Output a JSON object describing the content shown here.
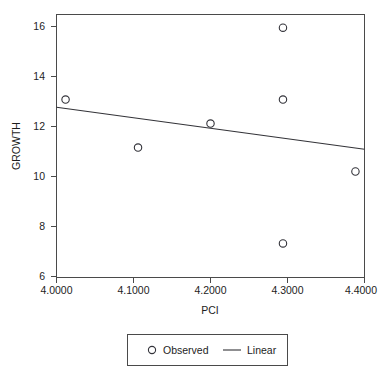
{
  "chart_data": {
    "type": "scatter",
    "title": "",
    "xlabel": "PCI",
    "ylabel": "GROWTH",
    "xlim": [
      3.9875,
      4.4125
    ],
    "ylim": [
      5.6,
      16.55
    ],
    "grid": false,
    "legend_position": "bottom",
    "x_ticks": [
      "4.0000",
      "4.1000",
      "4.2000",
      "4.3000",
      "4.4000"
    ],
    "x_tick_values": [
      4.0,
      4.1,
      4.2,
      4.3,
      4.4
    ],
    "y_ticks": [
      "6",
      "8",
      "10",
      "12",
      "14",
      "16"
    ],
    "y_tick_values": [
      6,
      8,
      10,
      12,
      14,
      16
    ],
    "series": [
      {
        "name": "Observed",
        "type": "scatter",
        "marker": "open-circle",
        "x": [
          4.0,
          4.1,
          4.2,
          4.3,
          4.3,
          4.3,
          4.4
        ],
        "y": [
          13,
          11,
          12,
          16,
          13,
          7,
          10
        ],
        "points": [
          {
            "x": 4.0,
            "y": 13
          },
          {
            "x": 4.1,
            "y": 11
          },
          {
            "x": 4.2,
            "y": 12
          },
          {
            "x": 4.3,
            "y": 16
          },
          {
            "x": 4.3,
            "y": 13
          },
          {
            "x": 4.3,
            "y": 7
          },
          {
            "x": 4.4,
            "y": 10
          }
        ]
      },
      {
        "name": "Linear",
        "type": "line",
        "x": [
          3.9875,
          4.4125
        ],
        "y": [
          12.68,
          10.93
        ]
      }
    ]
  },
  "axes": {
    "x_title": "PCI",
    "y_title": "GROWTH",
    "x_tick_labels": [
      "4.0000",
      "4.1000",
      "4.2000",
      "4.3000",
      "4.4000"
    ],
    "y_tick_labels": [
      "6",
      "8",
      "10",
      "12",
      "14",
      "16"
    ]
  },
  "legend": {
    "entries": [
      {
        "label": "Observed",
        "symbol": "open-circle"
      },
      {
        "label": "Linear",
        "symbol": "line-segment"
      }
    ]
  },
  "colors": {
    "frame": "#4a4a4a",
    "marker": "#33333a",
    "line": "#333338",
    "text": "#1d1d1d",
    "background": "#ffffff"
  }
}
